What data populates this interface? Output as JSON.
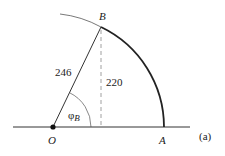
{
  "diagram": {
    "panel_label": "(a)",
    "points": {
      "O": {
        "label": "O"
      },
      "A": {
        "label": "A"
      },
      "B": {
        "label": "B"
      }
    },
    "lengths": {
      "OB": "246",
      "height": "220"
    },
    "angle": {
      "symbol": "φ",
      "subscript": "B"
    },
    "colors": {
      "stroke": "#222222",
      "thin_stroke": "#555555",
      "dashed": "#888888"
    }
  }
}
